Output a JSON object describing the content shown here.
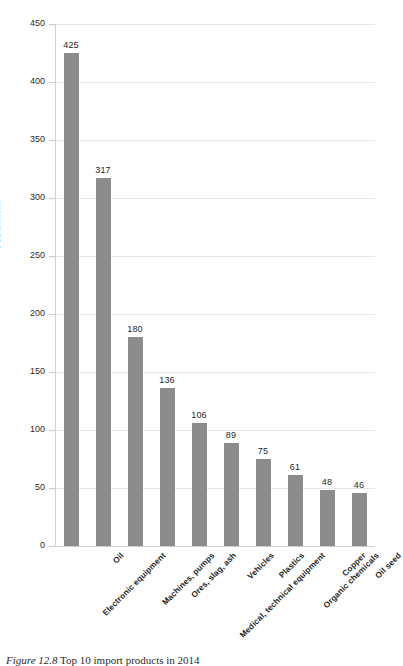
{
  "chart_data": {
    "type": "bar",
    "title": "",
    "xlabel": "",
    "ylabel": "US$ billions",
    "ylim": [
      0,
      450
    ],
    "ytick_step": 50,
    "yticks": [
      "0",
      "50",
      "100",
      "150",
      "200",
      "250",
      "300",
      "350",
      "400",
      "450"
    ],
    "grid": true,
    "legend": "none",
    "bar_color": "#8c8c8c",
    "gridline_color": "#e6e6e6",
    "categories": [
      "Electronic equipment",
      "Oil",
      "Machines, pumps",
      "Ores, slag, ash",
      "Medical, technical equipment",
      "Vehicles",
      "Plastics",
      "Organic chemicals",
      "Copper",
      "Oil seed"
    ],
    "values": [
      425,
      317,
      180,
      136,
      106,
      89,
      75,
      61,
      48,
      46
    ],
    "value_labels": [
      "425",
      "317",
      "180",
      "136",
      "106",
      "89",
      "75",
      "61",
      "48",
      "46"
    ]
  },
  "caption": {
    "number": "Figure 12.8",
    "text": "Top 10 import products in 2014",
    "full": "Figure 12.8  Top 10 import products in 2014"
  }
}
